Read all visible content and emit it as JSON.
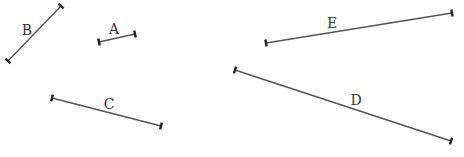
{
  "diagram": {
    "title": "",
    "segments": [
      {
        "id": "A",
        "label": "A",
        "x1": 99,
        "y1": 42,
        "x2": 135,
        "y2": 34,
        "label_x": 114,
        "label_y": 29
      },
      {
        "id": "B",
        "label": "B",
        "x1": 61,
        "y1": 6,
        "x2": 8,
        "y2": 61,
        "label_x": 27,
        "label_y": 30
      },
      {
        "id": "C",
        "label": "C",
        "x1": 52,
        "y1": 98,
        "x2": 161,
        "y2": 126,
        "label_x": 109,
        "label_y": 104
      },
      {
        "id": "D",
        "label": "D",
        "x1": 235,
        "y1": 70,
        "x2": 451,
        "y2": 141,
        "label_x": 356,
        "label_y": 100
      },
      {
        "id": "E",
        "label": "E",
        "x1": 266,
        "y1": 43,
        "x2": 452,
        "y2": 13,
        "label_x": 332,
        "label_y": 23
      }
    ]
  },
  "colors": {
    "line": "#555555",
    "tick": "#222222",
    "label": "#333333",
    "background": "#ffffff"
  }
}
